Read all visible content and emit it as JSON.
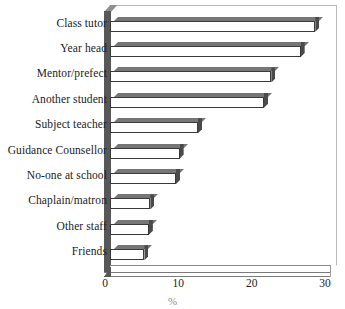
{
  "chart_data": {
    "type": "bar",
    "orientation": "horizontal",
    "title": "",
    "xlabel": "%",
    "ylabel": "",
    "xlim": [
      0,
      30
    ],
    "xticks": [
      0,
      10,
      20,
      30
    ],
    "grid": false,
    "legend": null,
    "categories": [
      "Class tutor",
      "Year head",
      "Mentor/prefect",
      "Another student",
      "Subject teacher",
      "Guidance Counsellor",
      "No-one at school",
      "Chaplain/matron",
      "Other staff",
      "Friends"
    ],
    "values": [
      28,
      26,
      22,
      21,
      12,
      9.5,
      9,
      5.5,
      5.3,
      4.7
    ],
    "bar_style": {
      "fill": "#ffffff",
      "edge": "#3a3a3a",
      "shadow_top": "#767676",
      "shadow_side": "#4a4a4a"
    }
  }
}
